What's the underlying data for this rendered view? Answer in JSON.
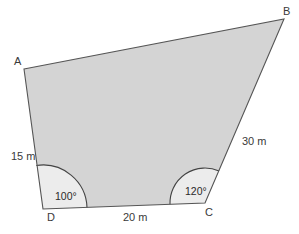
{
  "diagram": {
    "type": "quadrilateral",
    "vertices": {
      "A": {
        "label": "A",
        "x": 24,
        "y": 69
      },
      "B": {
        "label": "B",
        "x": 284,
        "y": 19
      },
      "C": {
        "label": "C",
        "x": 205,
        "y": 203
      },
      "D": {
        "label": "D",
        "x": 43,
        "y": 209
      }
    },
    "sides": {
      "AD": {
        "label": "15 m"
      },
      "BC": {
        "label": "30 m"
      },
      "DC": {
        "label": "20 m"
      }
    },
    "angles": {
      "D": {
        "label": "100°"
      },
      "C": {
        "label": "120°"
      }
    },
    "colors": {
      "fill": "#d4d4d4",
      "angle_fill": "#ececec",
      "stroke": "#555555",
      "text": "#3a3a3a"
    }
  }
}
